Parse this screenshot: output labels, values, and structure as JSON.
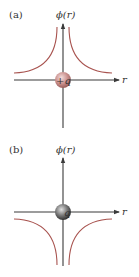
{
  "panels": [
    {
      "label": "(a)",
      "y_axis_label": "ϕ(r)",
      "x_axis_label": "r",
      "charge_label": "+q",
      "charge_sign": "positive",
      "potential_sign": "positive",
      "sphere_color": "#c98f8c",
      "curve_color": "#a8534f"
    },
    {
      "label": "(b)",
      "y_axis_label": "ϕ(r)",
      "x_axis_label": "r",
      "charge_label": "q",
      "charge_sign": "negative",
      "potential_sign": "negative",
      "sphere_color": "#7a7a7a",
      "curve_color": "#a8534f"
    }
  ]
}
